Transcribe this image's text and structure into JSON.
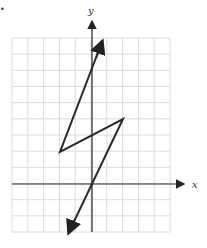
{
  "figure": {
    "marker": "•",
    "x_axis_label": "x",
    "y_axis_label": "y",
    "grid": {
      "x_min": -5,
      "x_max": 5,
      "y_min": -3,
      "y_max": 9,
      "step": 1
    },
    "colors": {
      "grid": "#dcdcdc",
      "axis": "#222222",
      "line": "#2a2a2a"
    }
  },
  "chart_data": {
    "type": "line",
    "title": "",
    "xlabel": "x",
    "ylabel": "y",
    "xlim": [
      -5,
      5
    ],
    "ylim": [
      -3,
      9
    ],
    "grid": true,
    "series": [
      {
        "name": "relation",
        "points": [
          [
            0.6,
            8.7
          ],
          [
            -2,
            2
          ],
          [
            2,
            4
          ],
          [
            -1.5,
            -3
          ]
        ],
        "arrows": "both ends"
      }
    ]
  }
}
